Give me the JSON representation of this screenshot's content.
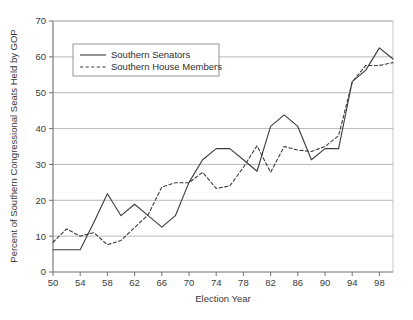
{
  "chart_data": {
    "type": "line",
    "title": "",
    "xlabel": "Election Year",
    "ylabel": "Percent of Southern Congressional Seats Held by GOP",
    "xlim": [
      50,
      100
    ],
    "ylim": [
      0,
      70
    ],
    "xticks": [
      "50",
      "54",
      "58",
      "62",
      "66",
      "70",
      "74",
      "78",
      "82",
      "86",
      "90",
      "94",
      "98"
    ],
    "xtick_values": [
      50,
      54,
      58,
      62,
      66,
      70,
      74,
      78,
      82,
      86,
      90,
      94,
      98
    ],
    "yticks": [
      "0",
      "10",
      "20",
      "30",
      "40",
      "50",
      "60",
      "70"
    ],
    "ytick_values": [
      0,
      10,
      20,
      30,
      40,
      50,
      60,
      70
    ],
    "grid": "horizontal",
    "legend_position": "upper-left",
    "x": [
      50,
      52,
      54,
      56,
      58,
      60,
      62,
      64,
      66,
      68,
      70,
      72,
      74,
      76,
      78,
      80,
      82,
      84,
      86,
      88,
      90,
      92,
      94,
      96,
      98,
      100
    ],
    "series": [
      {
        "name": "Southern Senators",
        "style": "solid",
        "color": "#3b3b3b",
        "values": [
          6.2,
          6.2,
          6.2,
          13.8,
          21.8,
          15.7,
          18.9,
          15.7,
          12.5,
          15.7,
          25.0,
          31.3,
          34.4,
          34.4,
          31.3,
          28.1,
          40.6,
          43.8,
          40.6,
          31.3,
          34.4,
          34.4,
          53.1,
          56.3,
          62.5,
          59.4
        ]
      },
      {
        "name": "Southern House Members",
        "style": "dashed",
        "color": "#3b3b3b",
        "values": [
          8.3,
          12.0,
          10.0,
          11.0,
          7.6,
          8.8,
          12.4,
          16.0,
          23.7,
          24.9,
          24.9,
          27.8,
          23.3,
          24.0,
          29.2,
          35.2,
          27.8,
          35.0,
          34.0,
          33.6,
          35.0,
          38.0,
          53.0,
          57.6,
          57.6,
          58.4
        ]
      }
    ]
  },
  "legend": {
    "items": [
      {
        "label": "Southern Senators",
        "style": "solid"
      },
      {
        "label": "Southern House Members",
        "style": "dashed"
      }
    ]
  },
  "colors": {
    "line": "#3b3b3b",
    "grid": "#9a9a9a",
    "axis": "#6e6e6e",
    "text": "#3a3a3a",
    "background": "#ffffff"
  }
}
